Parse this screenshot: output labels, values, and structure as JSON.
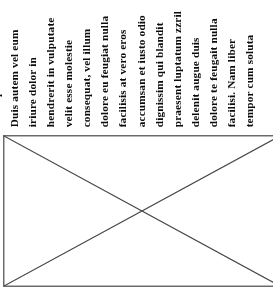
{
  "page": {
    "width": 273,
    "height": 302,
    "background_color": "#ffffff",
    "ink_color": "#131313",
    "orientation": "text-rotated-90-counterclockwise"
  },
  "text_block": {
    "name": "rotated-body-text",
    "reading_direction": "bottom-to-top",
    "line_count": 14,
    "line_spacing_px": 18,
    "clipped_at_top": true,
    "lines": [
      {
        "text": "consequat.",
        "x": 2,
        "truncated": false
      },
      {
        "text": "Duis autem vel eum",
        "x": 20,
        "truncated": true
      },
      {
        "text": "iriure dolor in",
        "x": 38,
        "truncated": false
      },
      {
        "text": "hendrerit in vulputate",
        "x": 56,
        "truncated": true
      },
      {
        "text": "velit esse molestie",
        "x": 74,
        "truncated": false
      },
      {
        "text": "consequat, vel illum",
        "x": 92,
        "truncated": true
      },
      {
        "text": "dolore eu feugiat nulla",
        "x": 110,
        "truncated": true
      },
      {
        "text": "facilisis at vero eros",
        "x": 128,
        "truncated": true
      },
      {
        "text": "accumsan et iusto odio",
        "x": 147,
        "truncated": true
      },
      {
        "text": "dignissim qui blandit",
        "x": 165,
        "truncated": true
      },
      {
        "text": "praesent luptatum zzril",
        "x": 183,
        "truncated": true
      },
      {
        "text": "delenit augue duis",
        "x": 201,
        "truncated": false
      },
      {
        "text": "dolore te feugait nulla",
        "x": 219,
        "truncated": true
      },
      {
        "text": "facilisi. Nam liber",
        "x": 237,
        "truncated": false
      },
      {
        "text": "tempor cum soluta",
        "x": 255,
        "truncated": false
      }
    ]
  },
  "figure": {
    "name": "image-placeholder-box",
    "type": "rectangle-with-x-diagonals",
    "border_color": "#6b6b6b",
    "fill_color": "#ffffff",
    "border_width_px": 1.5,
    "diagonal_width_px": 1.2,
    "left": 3,
    "top": 135,
    "width": 278,
    "height": 152,
    "clipped_right_edge": true,
    "interior_content": ""
  }
}
